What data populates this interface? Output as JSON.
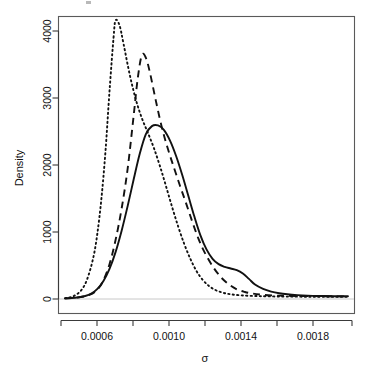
{
  "chart_data": {
    "type": "line",
    "title": "",
    "xlabel": "σ",
    "ylabel": "Density",
    "xlim": [
      0.00048,
      0.00192
    ],
    "ylim": [
      -120,
      4350
    ],
    "grid": false,
    "legend": null,
    "xticks": [
      0.0006,
      0.001,
      0.0014,
      0.0018
    ],
    "xtick_labels": [
      "0.0006",
      "0.0010",
      "0.0014",
      "0.0018"
    ],
    "xminor_ticks": [
      0.0008,
      0.0012,
      0.0016
    ],
    "yticks": [
      0,
      1000,
      2000,
      3000,
      4000
    ],
    "ytick_labels": [
      "0",
      "1000",
      "2000",
      "3000",
      "4000"
    ],
    "series": [
      {
        "name": "solid",
        "linestyle": "solid",
        "color": "#111111",
        "peak_x": 0.00096,
        "peak_y": 2590,
        "x": [
          0.0005,
          0.00055,
          0.0006,
          0.00063,
          0.00066,
          0.00069,
          0.00072,
          0.00075,
          0.00078,
          0.00081,
          0.00084,
          0.00087,
          0.0009,
          0.00093,
          0.00096,
          0.00099,
          0.00102,
          0.00105,
          0.00108,
          0.00111,
          0.00114,
          0.00117,
          0.0012,
          0.00123,
          0.00126,
          0.00129,
          0.00132,
          0.00135,
          0.00138,
          0.00141,
          0.00144,
          0.00148,
          0.00152,
          0.00156,
          0.0016,
          0.00165,
          0.0017,
          0.00176,
          0.00182,
          0.0019
        ],
        "y": [
          10,
          18,
          45,
          80,
          150,
          270,
          450,
          700,
          1020,
          1390,
          1790,
          2170,
          2460,
          2580,
          2590,
          2520,
          2360,
          2130,
          1850,
          1540,
          1230,
          950,
          740,
          600,
          520,
          480,
          455,
          430,
          380,
          300,
          215,
          150,
          110,
          85,
          70,
          58,
          50,
          45,
          42,
          40
        ]
      },
      {
        "name": "dashed",
        "linestyle": "dashed",
        "color": "#111111",
        "peak_x": 0.00088,
        "peak_y": 3650,
        "x": [
          0.0005,
          0.00056,
          0.00062,
          0.00066,
          0.00069,
          0.00072,
          0.00075,
          0.00078,
          0.00081,
          0.00084,
          0.00086,
          0.00088,
          0.0009,
          0.00092,
          0.00095,
          0.00098,
          0.00101,
          0.00104,
          0.00107,
          0.0011,
          0.00113,
          0.00116,
          0.00119,
          0.00123,
          0.00127,
          0.00131,
          0.00135,
          0.00139,
          0.00143,
          0.00148,
          0.00154,
          0.0016,
          0.00168,
          0.00176,
          0.00184,
          0.0019
        ],
        "y": [
          8,
          20,
          60,
          140,
          280,
          520,
          880,
          1350,
          1950,
          2750,
          3300,
          3640,
          3600,
          3380,
          2950,
          2550,
          2230,
          1950,
          1680,
          1420,
          1150,
          900,
          700,
          490,
          330,
          220,
          145,
          105,
          80,
          62,
          52,
          48,
          44,
          42,
          40,
          38
        ]
      },
      {
        "name": "dotted",
        "linestyle": "dotted",
        "color": "#111111",
        "peak_x": 0.00075,
        "peak_y": 4160,
        "x": [
          0.0005,
          0.00054,
          0.00058,
          0.00061,
          0.00064,
          0.00066,
          0.00068,
          0.0007,
          0.00072,
          0.00074,
          0.00075,
          0.00077,
          0.00079,
          0.00082,
          0.00085,
          0.00088,
          0.00091,
          0.00094,
          0.00097,
          0.001,
          0.00103,
          0.00106,
          0.00109,
          0.00112,
          0.00115,
          0.00118,
          0.00121,
          0.00124,
          0.00128,
          0.00132,
          0.00137,
          0.00143,
          0.0015,
          0.0016,
          0.00172,
          0.00184,
          0.0019
        ],
        "y": [
          12,
          40,
          130,
          300,
          620,
          980,
          1500,
          2200,
          3100,
          3900,
          4160,
          4080,
          3800,
          3350,
          2980,
          2700,
          2480,
          2250,
          1980,
          1680,
          1370,
          1080,
          820,
          600,
          420,
          290,
          200,
          140,
          95,
          70,
          55,
          46,
          40,
          36,
          34,
          33,
          32
        ]
      }
    ]
  },
  "axes": {
    "y_axis_title": "Density",
    "x_axis_title": "σ",
    "y_tick_labels": [
      "0",
      "1000",
      "2000",
      "3000",
      "4000"
    ],
    "x_tick_labels": [
      "0.0006",
      "0.0010",
      "0.0014",
      "0.0018"
    ]
  },
  "colors": {
    "curve": "#111111",
    "axis": "#3a3a3a",
    "box": "#5a5a5a",
    "baseline": "#c8c8c8",
    "background": "#ffffff"
  }
}
